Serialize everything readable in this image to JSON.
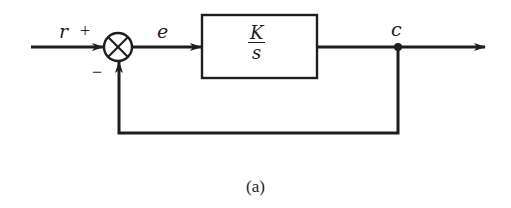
{
  "diagram": {
    "type": "block-diagram",
    "signals": {
      "input": "r",
      "error": "e",
      "output": "c"
    },
    "summing_junction": {
      "plus_sign": "+",
      "minus_sign": "−"
    },
    "block": {
      "numerator": "K",
      "denominator": "s"
    },
    "caption": "(a)",
    "colors": {
      "stroke": "#1e1e1e",
      "background": "#ffffff"
    }
  }
}
